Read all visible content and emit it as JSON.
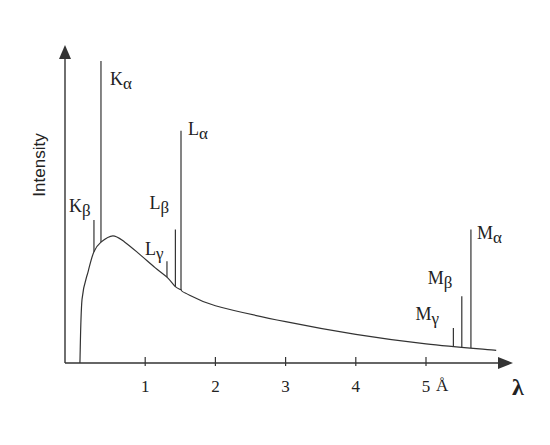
{
  "chart_data": {
    "type": "line",
    "title": "",
    "xlabel": "λ",
    "ylabel": "Intensity",
    "x_unit": "Å",
    "xlim": [
      0,
      6.2
    ],
    "ylim": [
      0,
      100
    ],
    "grid": false,
    "legend": null,
    "x_ticks": [
      1,
      2,
      3,
      4,
      5
    ],
    "x_tick_labels": [
      "1",
      "2",
      "3",
      "4",
      "5"
    ],
    "continuum": {
      "name": "Bremsstrahlung continuum",
      "x": [
        0.07,
        0.1,
        0.19,
        0.27,
        0.37,
        0.54,
        0.71,
        0.93,
        1.14,
        1.31,
        1.43,
        1.51,
        1.57,
        2.0,
        3.0,
        4.0,
        5.0,
        6.0
      ],
      "y": [
        0,
        20,
        29,
        35,
        38,
        40,
        38,
        34,
        30,
        27,
        24,
        23,
        22,
        18,
        13,
        9,
        6,
        4
      ]
    },
    "peaks": [
      {
        "label": "K",
        "sub": "β",
        "x": 0.27,
        "intensity": 45
      },
      {
        "label": "K",
        "sub": "α",
        "x": 0.37,
        "intensity": 95
      },
      {
        "label": "L",
        "sub": "γ",
        "x": 1.31,
        "intensity": 32
      },
      {
        "label": "L",
        "sub": "β",
        "x": 1.43,
        "intensity": 42
      },
      {
        "label": "L",
        "sub": "α",
        "x": 1.51,
        "intensity": 73
      },
      {
        "label": "M",
        "sub": "γ",
        "x": 5.39,
        "intensity": 11
      },
      {
        "label": "M",
        "sub": "β",
        "x": 5.51,
        "intensity": 21
      },
      {
        "label": "M",
        "sub": "α",
        "x": 5.64,
        "intensity": 42
      }
    ]
  },
  "layout": {
    "origin_px": [
      75,
      363
    ],
    "px_per_unit_x": 70.2,
    "px_per_unit_y": 3.18,
    "yaxis_x_px": 65,
    "yaxis_top_px": 45,
    "xaxis_end_px": 513,
    "stroke": "#333333"
  }
}
